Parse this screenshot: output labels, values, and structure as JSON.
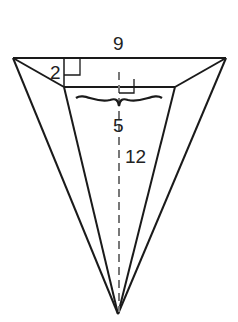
{
  "figure": {
    "type": "square pyramid (frustum cross-section view)",
    "labels": {
      "top_width": "9",
      "left_height": "2",
      "inner_width": "5",
      "slant_height": "12"
    },
    "colors": {
      "stroke": "#1a1a1a",
      "dashed": "#777777",
      "background": "#ffffff"
    }
  }
}
